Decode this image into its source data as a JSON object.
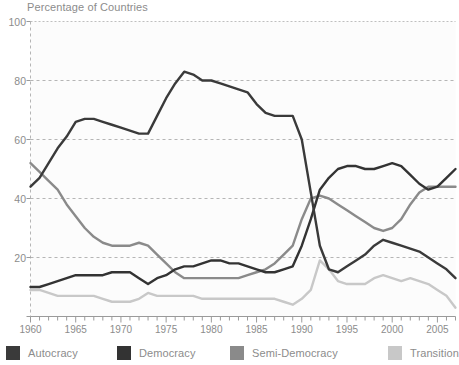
{
  "chart_data": {
    "type": "line",
    "title": "Percentage of Countries",
    "xlabel": "",
    "ylabel": "Percentage of Countries",
    "xlim": [
      1960,
      2007
    ],
    "ylim": [
      0,
      100
    ],
    "yticks": [
      0,
      20,
      40,
      60,
      80,
      100
    ],
    "ytick_labels": [
      "",
      "20",
      "40",
      "60",
      "80",
      "100"
    ],
    "xticks": [
      1960,
      1965,
      1970,
      1975,
      1980,
      1985,
      1990,
      1995,
      2000,
      2005
    ],
    "xtick_labels": [
      "1960",
      "1965",
      "1970",
      "1975",
      "1980",
      "1985",
      "1990",
      "1995",
      "2000",
      "2005"
    ],
    "x_minor_tick_step": 1,
    "grid": "horizontal-dashed",
    "legend_position": "bottom",
    "x": [
      1960,
      1961,
      1962,
      1963,
      1964,
      1965,
      1966,
      1967,
      1968,
      1969,
      1970,
      1971,
      1972,
      1973,
      1974,
      1975,
      1976,
      1977,
      1978,
      1979,
      1980,
      1981,
      1982,
      1983,
      1984,
      1985,
      1986,
      1987,
      1988,
      1989,
      1990,
      1991,
      1992,
      1993,
      1994,
      1995,
      1996,
      1997,
      1998,
      1999,
      2000,
      2001,
      2002,
      2003,
      2004,
      2005,
      2006,
      2007
    ],
    "series": [
      {
        "name": "Autocracy",
        "color": "#3a3a3a",
        "values": [
          44,
          47,
          52,
          57,
          61,
          66,
          67,
          67,
          66,
          65,
          64,
          63,
          62,
          62,
          68,
          74,
          79,
          83,
          82,
          80,
          80,
          79,
          78,
          77,
          76,
          72,
          69,
          68,
          68,
          68,
          60,
          42,
          24,
          16,
          15,
          17,
          19,
          21,
          24,
          26,
          25,
          24,
          23,
          22,
          20,
          18,
          16,
          13
        ]
      },
      {
        "name": "Democracy",
        "color": "#333333",
        "values": [
          10,
          10,
          11,
          12,
          13,
          14,
          14,
          14,
          14,
          15,
          15,
          15,
          13,
          11,
          13,
          14,
          16,
          17,
          17,
          18,
          19,
          19,
          18,
          18,
          17,
          16,
          15,
          15,
          16,
          17,
          24,
          33,
          43,
          47,
          50,
          51,
          51,
          50,
          50,
          51,
          52,
          51,
          48,
          45,
          43,
          44,
          47,
          50
        ]
      },
      {
        "name": "Semi-Democracy",
        "color": "#8a8a8a",
        "values": [
          52,
          49,
          46,
          43,
          38,
          34,
          30,
          27,
          25,
          24,
          24,
          24,
          25,
          24,
          21,
          18,
          15,
          13,
          13,
          13,
          13,
          13,
          13,
          13,
          14,
          15,
          16,
          18,
          21,
          24,
          33,
          40,
          41,
          40,
          38,
          36,
          34,
          32,
          30,
          29,
          30,
          33,
          38,
          42,
          44,
          44,
          44,
          44
        ]
      },
      {
        "name": "Transition",
        "color": "#c8c8c8",
        "values": [
          9,
          9,
          8,
          7,
          7,
          7,
          7,
          7,
          6,
          5,
          5,
          5,
          6,
          8,
          7,
          7,
          7,
          7,
          7,
          6,
          6,
          6,
          6,
          6,
          6,
          6,
          6,
          6,
          5,
          4,
          6,
          9,
          19,
          16,
          12,
          11,
          11,
          11,
          13,
          14,
          13,
          12,
          13,
          12,
          11,
          9,
          7,
          3
        ]
      }
    ]
  },
  "legend": {
    "entries": [
      {
        "label": "Autocracy"
      },
      {
        "label": "Democracy"
      },
      {
        "label": "Semi-Democracy"
      },
      {
        "label": "Transition"
      }
    ]
  }
}
